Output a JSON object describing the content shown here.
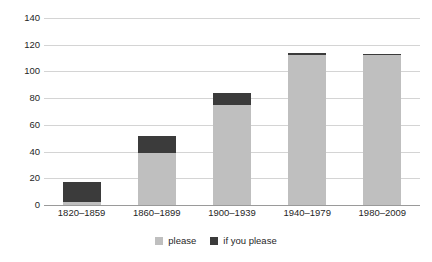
{
  "chart_data": {
    "type": "bar",
    "subtype": "stacked-bar",
    "title": "",
    "subtitle": "",
    "xlabel": "",
    "ylabel": "",
    "categories": [
      "1820–1859",
      "1860–1899",
      "1900–1939",
      "1940–1979",
      "1980–2009"
    ],
    "series": [
      {
        "name": "please",
        "color": "#bfbfbf",
        "values": [
          2,
          39,
          75,
          112,
          112
        ]
      },
      {
        "name": "if you please",
        "color": "#3b3b3b",
        "values": [
          15,
          13,
          9,
          2,
          1
        ]
      }
    ],
    "totals": [
      17,
      52,
      84,
      114,
      113
    ],
    "ylim": [
      0,
      140
    ],
    "ytick_step": 20,
    "yticks": [
      "140",
      "120",
      "100",
      "80",
      "60",
      "40",
      "20",
      "0"
    ],
    "ytick_values": [
      140,
      120,
      100,
      80,
      60,
      40,
      20,
      0
    ],
    "grid": true,
    "grid_axis": "y",
    "grid_color": "#d4d4d4",
    "axis_color": "#9a9a9a",
    "legend_position": "bottom",
    "legend": [
      {
        "label": "please",
        "color": "#bfbfbf"
      },
      {
        "label": "if you please",
        "color": "#3b3b3b"
      }
    ]
  }
}
